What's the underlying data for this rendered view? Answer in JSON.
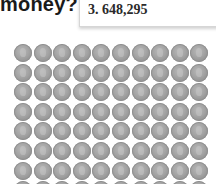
{
  "heading": {
    "text": "money?"
  },
  "answer_box": {
    "text": "3. 648,295"
  },
  "coin_grid": {
    "columns": 10,
    "rows_visible": 8,
    "coin_count": 80,
    "icon": "dime-coin-icon",
    "color": "#a3a3a3"
  }
}
